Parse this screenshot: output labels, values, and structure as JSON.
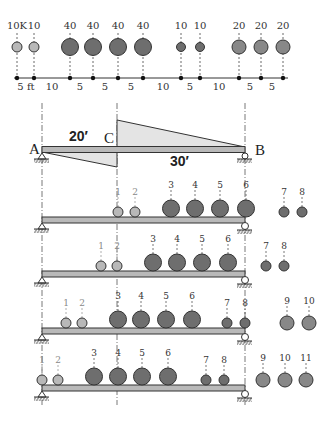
{
  "colors": {
    "heavy_wheel": "#6e6e6e",
    "medium_wheel": "#888888",
    "light_wheel": "#b8b8b8",
    "beam_fill": "#b9b9b9",
    "influence_fill": "#e4e4e4",
    "stroke": "#333333"
  },
  "truck": {
    "units_label": "ft",
    "axles": [
      {
        "x": 17,
        "label": "10K",
        "size": "light"
      },
      {
        "x": 34,
        "label": "10",
        "size": "light"
      },
      {
        "x": 70,
        "label": "40",
        "size": "heavy"
      },
      {
        "x": 93,
        "label": "40",
        "size": "heavy"
      },
      {
        "x": 118,
        "label": "40",
        "size": "heavy"
      },
      {
        "x": 143,
        "label": "40",
        "size": "heavy"
      },
      {
        "x": 181,
        "label": "10",
        "size": "small"
      },
      {
        "x": 200,
        "label": "10",
        "size": "small"
      },
      {
        "x": 239,
        "label": "20",
        "size": "medium"
      },
      {
        "x": 261,
        "label": "20",
        "size": "medium"
      },
      {
        "x": 283,
        "label": "20",
        "size": "medium"
      }
    ],
    "spacings": [
      {
        "x": 26,
        "label": "5 ft"
      },
      {
        "x": 52,
        "label": "10"
      },
      {
        "x": 80,
        "label": "5"
      },
      {
        "x": 105,
        "label": "5"
      },
      {
        "x": 131,
        "label": "5"
      },
      {
        "x": 163,
        "label": "10"
      },
      {
        "x": 190,
        "label": "5"
      },
      {
        "x": 219,
        "label": "10"
      },
      {
        "x": 250,
        "label": "5"
      },
      {
        "x": 272,
        "label": "5"
      }
    ]
  },
  "influence_line": {
    "point_a": "A",
    "point_b": "B",
    "point_c": "C",
    "span_ac": "20′",
    "span_cb": "30′"
  },
  "load_cases": [
    {
      "wheels": [
        {
          "x": 118,
          "n": "1",
          "size": "light"
        },
        {
          "x": 135,
          "n": "2",
          "size": "light"
        },
        {
          "x": 171,
          "n": "3",
          "size": "heavy"
        },
        {
          "x": 195,
          "n": "4",
          "size": "heavy"
        },
        {
          "x": 220,
          "n": "5",
          "size": "heavy"
        },
        {
          "x": 246,
          "n": "6",
          "size": "heavy"
        },
        {
          "x": 284,
          "n": "7",
          "size": "small"
        },
        {
          "x": 302,
          "n": "8",
          "size": "small"
        }
      ]
    },
    {
      "wheels": [
        {
          "x": 101,
          "n": "1",
          "size": "light"
        },
        {
          "x": 117,
          "n": "2",
          "size": "light"
        },
        {
          "x": 153,
          "n": "3",
          "size": "heavy"
        },
        {
          "x": 177,
          "n": "4",
          "size": "heavy"
        },
        {
          "x": 202,
          "n": "5",
          "size": "heavy"
        },
        {
          "x": 228,
          "n": "6",
          "size": "heavy"
        },
        {
          "x": 266,
          "n": "7",
          "size": "small"
        },
        {
          "x": 284,
          "n": "8",
          "size": "small"
        }
      ]
    },
    {
      "wheels": [
        {
          "x": 66,
          "n": "1",
          "size": "light"
        },
        {
          "x": 82,
          "n": "2",
          "size": "light"
        },
        {
          "x": 118,
          "n": "3",
          "size": "heavy"
        },
        {
          "x": 141,
          "n": "4",
          "size": "heavy"
        },
        {
          "x": 166,
          "n": "5",
          "size": "heavy"
        },
        {
          "x": 192,
          "n": "6",
          "size": "heavy"
        },
        {
          "x": 227,
          "n": "7",
          "size": "small"
        },
        {
          "x": 245,
          "n": "8",
          "size": "small"
        },
        {
          "x": 287,
          "n": "9",
          "size": "medium"
        },
        {
          "x": 309,
          "n": "10",
          "size": "medium"
        }
      ]
    },
    {
      "wheels": [
        {
          "x": 42,
          "n": "1",
          "size": "light"
        },
        {
          "x": 58,
          "n": "2",
          "size": "light"
        },
        {
          "x": 94,
          "n": "3",
          "size": "heavy"
        },
        {
          "x": 118,
          "n": "4",
          "size": "heavy"
        },
        {
          "x": 142,
          "n": "5",
          "size": "heavy"
        },
        {
          "x": 168,
          "n": "6",
          "size": "heavy"
        },
        {
          "x": 206,
          "n": "7",
          "size": "small"
        },
        {
          "x": 224,
          "n": "8",
          "size": "small"
        },
        {
          "x": 263,
          "n": "9",
          "size": "medium"
        },
        {
          "x": 285,
          "n": "10",
          "size": "medium"
        },
        {
          "x": 306,
          "n": "11",
          "size": "medium"
        }
      ]
    }
  ]
}
